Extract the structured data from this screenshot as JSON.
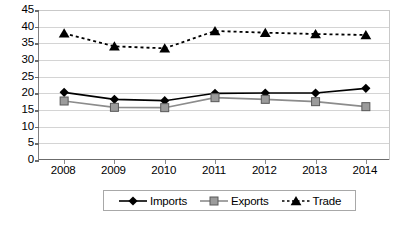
{
  "chart_data": {
    "type": "line",
    "title": "",
    "xlabel": "",
    "ylabel": "",
    "categories": [
      "2008",
      "2009",
      "2010",
      "2011",
      "2012",
      "2013",
      "2014"
    ],
    "x": [
      2008,
      2009,
      2010,
      2011,
      2012,
      2013,
      2014
    ],
    "ylim": [
      0,
      45
    ],
    "yticks": [
      0,
      5,
      10,
      15,
      20,
      25,
      30,
      35,
      40,
      45
    ],
    "grid": true,
    "legend_position": "bottom",
    "series": [
      {
        "name": "Imports",
        "marker": "diamond",
        "linestyle": "solid",
        "color": "#000000",
        "values": [
          20.3,
          18.2,
          17.8,
          20.0,
          20.1,
          20.1,
          21.5
        ]
      },
      {
        "name": "Exports",
        "marker": "square",
        "linestyle": "solid",
        "color": "#8c8c8c",
        "values": [
          17.7,
          15.8,
          15.7,
          18.7,
          18.2,
          17.5,
          16.0
        ]
      },
      {
        "name": "Trade",
        "marker": "triangle",
        "linestyle": "dotted",
        "color": "#000000",
        "values": [
          38.0,
          34.1,
          33.5,
          38.7,
          38.2,
          37.8,
          37.5
        ]
      }
    ]
  },
  "axis": {
    "y_tick_labels": [
      "45",
      "40",
      "35",
      "30",
      "25",
      "20",
      "15",
      "10",
      "5",
      "0"
    ],
    "x_tick_labels": [
      "2008",
      "2009",
      "2010",
      "2011",
      "2012",
      "2013",
      "2014"
    ]
  },
  "legend": {
    "items": [
      {
        "label": "Imports",
        "marker": "diamond",
        "color": "#000000",
        "linestyle": "solid"
      },
      {
        "label": "Exports",
        "marker": "square",
        "color": "#8c8c8c",
        "linestyle": "solid"
      },
      {
        "label": "Trade",
        "marker": "triangle",
        "color": "#000000",
        "linestyle": "dotted"
      }
    ]
  },
  "caption": {
    "text": ""
  },
  "colors": {
    "imports": "#000000",
    "exports": "#8c8c8c",
    "trade": "#000000",
    "gridline": "#d4d4d4",
    "axis": "#6b6b6b"
  }
}
